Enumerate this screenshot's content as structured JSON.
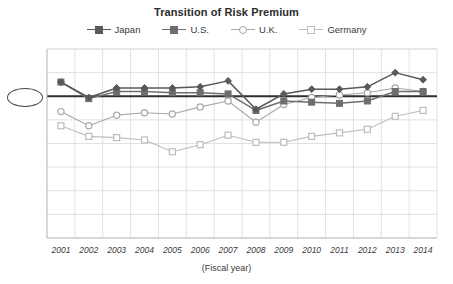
{
  "chart_data": {
    "type": "line",
    "title": "Transition of Risk Premium",
    "xlabel": "(Fiscal year)",
    "ylabel": "",
    "categories": [
      "2001",
      "2002",
      "2003",
      "2004",
      "2005",
      "2006",
      "2007",
      "2008",
      "2009",
      "2010",
      "2011",
      "2012",
      "2013",
      "2014"
    ],
    "ylim": [
      0.0,
      8.0
    ],
    "yticks": [
      "0.0%",
      "1.0%",
      "2.0%",
      "3.0%",
      "4.0%",
      "5.0%",
      "6.0%",
      "7.0%",
      "8.0%"
    ],
    "ytick_values": [
      0.0,
      1.0,
      2.0,
      3.0,
      4.0,
      5.0,
      6.0,
      7.0,
      8.0
    ],
    "grid": true,
    "legend_position": "top",
    "highlight": {
      "label": "6.0%",
      "value": 6.0,
      "style": "ellipse-outline-with-bold-reference-line"
    },
    "series": [
      {
        "name": "Japan",
        "marker": "diamond",
        "filled": true,
        "color": "#595959",
        "values": [
          6.6,
          5.95,
          6.35,
          6.35,
          6.35,
          6.4,
          6.65,
          5.45,
          6.1,
          6.3,
          6.3,
          6.4,
          7.0,
          6.7
        ]
      },
      {
        "name": "U.S.",
        "marker": "square",
        "filled": true,
        "color": "#6e6e6e",
        "values": [
          6.6,
          5.9,
          6.2,
          6.2,
          6.15,
          6.15,
          6.1,
          5.4,
          5.8,
          5.75,
          5.7,
          5.8,
          6.2,
          6.2
        ]
      },
      {
        "name": "U.K.",
        "marker": "circle",
        "filled": false,
        "color": "#a8a8a8",
        "values": [
          5.35,
          4.75,
          5.2,
          5.3,
          5.25,
          5.55,
          5.8,
          4.9,
          5.65,
          5.95,
          6.05,
          6.15,
          6.35,
          6.2
        ]
      },
      {
        "name": "Germany",
        "marker": "square",
        "filled": false,
        "color": "#bdbdbd",
        "values": [
          4.75,
          4.3,
          4.25,
          4.15,
          3.65,
          3.95,
          4.35,
          4.05,
          4.05,
          4.3,
          4.45,
          4.6,
          5.15,
          5.4
        ]
      }
    ]
  }
}
